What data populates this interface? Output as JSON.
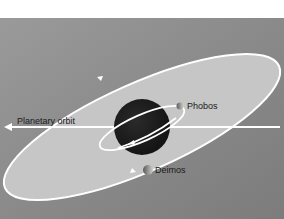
{
  "diagram": {
    "labels": {
      "planetary_orbit": "Planetary orbit",
      "phobos": "Phobos",
      "deimos": "Deimos"
    },
    "colors": {
      "background_panel": "#8e8e8e",
      "orbit_fill": "#c9c9c9",
      "orbit_line": "#ffffff",
      "planet": "#1c1c1c",
      "moon": "#9a9a9a",
      "page": "#ffffff"
    },
    "elements": {
      "planet": "Mars (dark sphere)",
      "moons": [
        "Phobos",
        "Deimos"
      ]
    }
  }
}
